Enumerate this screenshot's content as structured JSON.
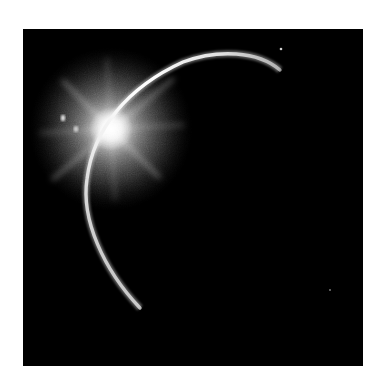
{
  "image": {
    "subject": "eclipse crescent with sun flare",
    "alt": "Thin bright crescent of a planet's limb against black space with a bright sunburst flare at upper left"
  },
  "colors": {
    "page_background": "#ffffff",
    "space": "#000000",
    "limb": "#e8e8e8",
    "flare": "#ffffff"
  }
}
